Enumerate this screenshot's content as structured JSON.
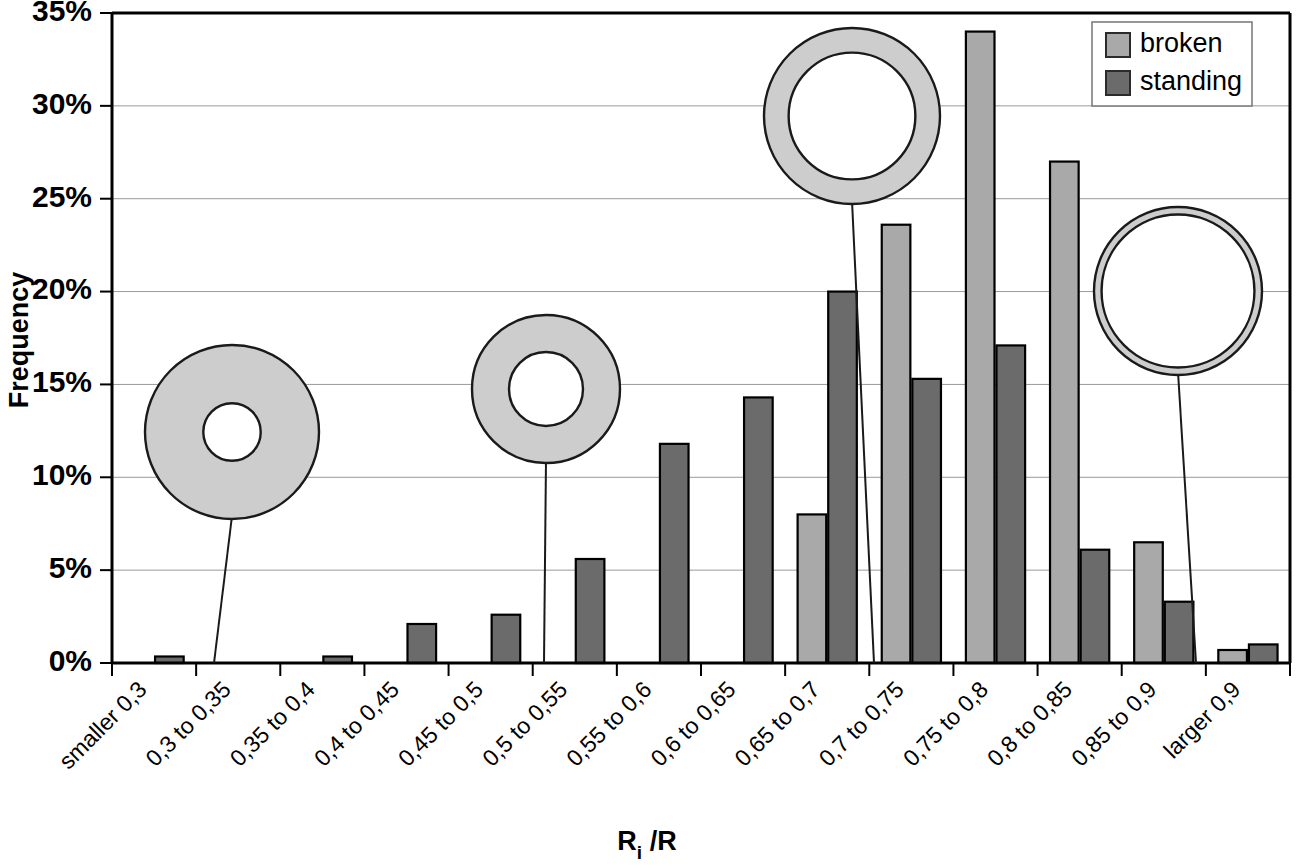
{
  "chart_data": {
    "type": "bar",
    "title": "",
    "xlabel": "Ri /R",
    "xlabel_base": "R",
    "xlabel_sub": "i",
    "xlabel_tail": " /R",
    "ylabel": "Frequency",
    "ylim": [
      0,
      35
    ],
    "ytick_labels": [
      "0%",
      "5%",
      "10%",
      "15%",
      "20%",
      "25%",
      "30%",
      "35%"
    ],
    "ytick_values": [
      0,
      5,
      10,
      15,
      20,
      25,
      30,
      35
    ],
    "grid": true,
    "legend_position": "top-right",
    "categories": [
      "smaller 0,3",
      "0,3 to 0,35",
      "0,35 to 0,4",
      "0,4 to 0,45",
      "0,45 to 0,5",
      "0,5 to 0,55",
      "0,55 to 0,6",
      "0,6 to 0,65",
      "0,65 to 0,7",
      "0,7 to 0,75",
      "0,75 to 0,8",
      "0,8 to 0,85",
      "0,85 to 0,9",
      "larger 0,9"
    ],
    "series": [
      {
        "name": "broken",
        "color": "#a9a9a9",
        "values": [
          0,
          0,
          0,
          0,
          0,
          0,
          0,
          0,
          8.0,
          23.6,
          34.0,
          27.0,
          6.5,
          0.7
        ]
      },
      {
        "name": "standing",
        "color": "#6b6b6b",
        "values": [
          0.35,
          0,
          0.35,
          2.1,
          2.6,
          5.6,
          11.8,
          14.3,
          20.0,
          15.3,
          17.1,
          6.1,
          3.3,
          1.0
        ]
      }
    ],
    "annotations": [
      {
        "name": "ring-thick-small-hole",
        "ratio": 0.33,
        "anchor_category": "0,3 to 0,35"
      },
      {
        "name": "ring-medium-hole",
        "ratio": 0.5,
        "anchor_category": "0,5 to 0,55"
      },
      {
        "name": "ring-thin-large-hole",
        "ratio": 0.72,
        "anchor_category": "0,7 to 0,75"
      },
      {
        "name": "ring-very-thin",
        "ratio": 0.91,
        "anchor_category": "larger 0,9"
      }
    ]
  },
  "legend": {
    "items": [
      {
        "label": "broken"
      },
      {
        "label": "standing"
      }
    ]
  }
}
